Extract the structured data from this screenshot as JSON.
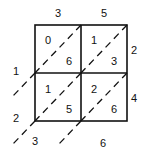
{
  "diagram": {
    "type": "lattice-multiplication",
    "top_digits": [
      "3",
      "5"
    ],
    "right_digits": [
      "2",
      "4"
    ],
    "cells": [
      {
        "row": 0,
        "col": 0,
        "tens": "0",
        "ones": "6"
      },
      {
        "row": 0,
        "col": 1,
        "tens": "1",
        "ones": "3"
      },
      {
        "row": 1,
        "col": 0,
        "tens": "1",
        "ones": "5"
      },
      {
        "row": 1,
        "col": 1,
        "tens": "2",
        "ones": "6"
      }
    ],
    "left_result_digits": [
      "1",
      "2"
    ],
    "bottom_result_digits": [
      "3",
      "6"
    ]
  }
}
